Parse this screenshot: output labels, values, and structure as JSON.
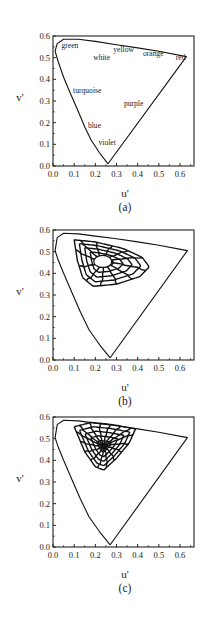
{
  "figure": {
    "ylabel": "v'",
    "xlabel": "u'",
    "xticks": [
      "0.0",
      "0.1",
      "0.2",
      "0.3",
      "0.4",
      "0.5",
      "0.6"
    ],
    "yticks": [
      "0.0",
      "0.1",
      "0.2",
      "0.3",
      "0.4",
      "0.5",
      "0.6"
    ]
  },
  "chart_data": [
    {
      "type": "line",
      "panel_label": "(a)",
      "title": "",
      "xlabel": "u'",
      "ylabel": "v'",
      "xlim": [
        0.0,
        0.66
      ],
      "ylim": [
        0.0,
        0.6
      ],
      "grid": false,
      "series": [
        {
          "name": "spectrum-locus",
          "points": [
            [
              0.26,
              0.01
            ],
            [
              0.22,
              0.06
            ],
            [
              0.18,
              0.12
            ],
            [
              0.15,
              0.18
            ],
            [
              0.12,
              0.25
            ],
            [
              0.08,
              0.34
            ],
            [
              0.05,
              0.41
            ],
            [
              0.025,
              0.48
            ],
            [
              0.01,
              0.53
            ],
            [
              0.02,
              0.565
            ],
            [
              0.05,
              0.585
            ],
            [
              0.12,
              0.585
            ],
            [
              0.2,
              0.575
            ],
            [
              0.3,
              0.56
            ],
            [
              0.4,
              0.545
            ],
            [
              0.5,
              0.53
            ],
            [
              0.63,
              0.505
            ],
            [
              0.26,
              0.01
            ]
          ]
        }
      ],
      "annotations": [
        {
          "text": "green",
          "u": 0.04,
          "v": 0.545
        },
        {
          "text": "white",
          "u": 0.19,
          "v": 0.49
        },
        {
          "text": "yellow",
          "u": 0.285,
          "v": 0.525
        },
        {
          "text": "orange",
          "u": 0.425,
          "v": 0.51
        },
        {
          "text": "red",
          "u": 0.58,
          "v": 0.49
        },
        {
          "text": "turquoise",
          "u": 0.095,
          "v": 0.335
        },
        {
          "text": "purple",
          "u": 0.335,
          "v": 0.275
        },
        {
          "text": "blue",
          "u": 0.165,
          "v": 0.175
        },
        {
          "text": "violet",
          "u": 0.215,
          "v": 0.095
        }
      ]
    },
    {
      "type": "line",
      "panel_label": "(b)",
      "xlabel": "u'",
      "ylabel": "v'",
      "xlim": [
        0.0,
        0.66
      ],
      "ylim": [
        0.0,
        0.6
      ],
      "grid": false,
      "web": {
        "center": [
          0.235,
          0.455
        ],
        "rings": 5,
        "spokes": 12,
        "outer": [
          [
            0.1,
            0.555
          ],
          [
            0.2,
            0.545
          ],
          [
            0.33,
            0.515
          ],
          [
            0.42,
            0.475
          ],
          [
            0.455,
            0.43
          ],
          [
            0.41,
            0.385
          ],
          [
            0.3,
            0.35
          ],
          [
            0.19,
            0.34
          ],
          [
            0.14,
            0.38
          ],
          [
            0.115,
            0.46
          ],
          [
            0.1,
            0.555
          ]
        ]
      },
      "series": [
        {
          "name": "spectrum-locus",
          "points": [
            [
              0.27,
              0.01
            ],
            [
              0.22,
              0.07
            ],
            [
              0.17,
              0.14
            ],
            [
              0.13,
              0.22
            ],
            [
              0.09,
              0.31
            ],
            [
              0.05,
              0.4
            ],
            [
              0.025,
              0.46
            ],
            [
              0.01,
              0.505
            ],
            [
              0.02,
              0.565
            ],
            [
              0.05,
              0.585
            ],
            [
              0.12,
              0.582
            ],
            [
              0.2,
              0.572
            ],
            [
              0.3,
              0.56
            ],
            [
              0.4,
              0.545
            ],
            [
              0.5,
              0.53
            ],
            [
              0.635,
              0.505
            ],
            [
              0.27,
              0.01
            ]
          ]
        }
      ]
    },
    {
      "type": "line",
      "panel_label": "(c)",
      "xlabel": "u'",
      "ylabel": "v'",
      "xlim": [
        0.0,
        0.66
      ],
      "ylim": [
        0.0,
        0.6
      ],
      "grid": false,
      "web": {
        "center": [
          0.24,
          0.465
        ],
        "rings": 5,
        "spokes": 16,
        "outer": [
          [
            0.1,
            0.555
          ],
          [
            0.18,
            0.575
          ],
          [
            0.28,
            0.565
          ],
          [
            0.39,
            0.545
          ],
          [
            0.36,
            0.48
          ],
          [
            0.3,
            0.41
          ],
          [
            0.24,
            0.355
          ],
          [
            0.2,
            0.37
          ],
          [
            0.15,
            0.44
          ],
          [
            0.1,
            0.555
          ]
        ]
      },
      "series": [
        {
          "name": "spectrum-locus",
          "points": [
            [
              0.27,
              0.01
            ],
            [
              0.22,
              0.07
            ],
            [
              0.17,
              0.14
            ],
            [
              0.13,
              0.22
            ],
            [
              0.09,
              0.31
            ],
            [
              0.05,
              0.4
            ],
            [
              0.025,
              0.46
            ],
            [
              0.01,
              0.505
            ],
            [
              0.02,
              0.565
            ],
            [
              0.05,
              0.585
            ],
            [
              0.12,
              0.582
            ],
            [
              0.2,
              0.572
            ],
            [
              0.3,
              0.56
            ],
            [
              0.4,
              0.545
            ],
            [
              0.5,
              0.53
            ],
            [
              0.635,
              0.505
            ],
            [
              0.27,
              0.01
            ]
          ]
        }
      ]
    }
  ]
}
